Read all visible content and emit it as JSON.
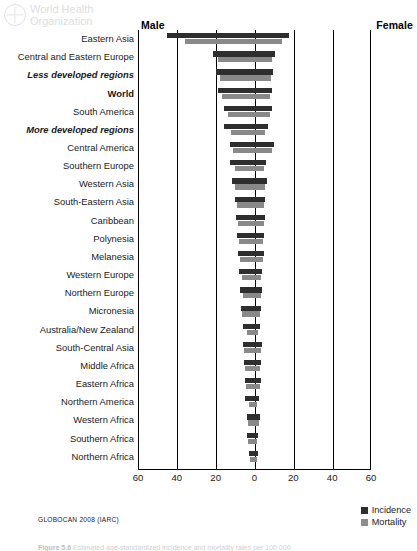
{
  "watermark": {
    "line1": "World Health",
    "line2": "Organization",
    "emblem_icon": "who-emblem-icon"
  },
  "header": {
    "male_label": "Male",
    "female_label": "Female"
  },
  "source_note": "GLOBOCAN 2008 (IARC)",
  "caption": {
    "number": "Figure 5.6",
    "text": "Estimated age-standardized incidence and mortality rates per 100 000"
  },
  "legend": {
    "position": "bottom-right",
    "items": [
      {
        "label": "Incidence",
        "color": "#2e2e2e"
      },
      {
        "label": "Mortality",
        "color": "#898989"
      }
    ]
  },
  "chart_data": {
    "type": "bar",
    "subtype": "diverging-butterfly",
    "title": "",
    "xlabel": "",
    "ylabel": "",
    "xlim": [
      -60,
      60
    ],
    "xticks": [
      60,
      40,
      20,
      0,
      20,
      40,
      60
    ],
    "tick_positions": [
      -60,
      -40,
      -20,
      0,
      20,
      40,
      60
    ],
    "gridlines": [
      -40,
      -20,
      0,
      20,
      40
    ],
    "grid": true,
    "axis_note": "Left half = Male rate, right half = Female rate; both plotted as positive magnitudes outward from 0",
    "series": [
      {
        "name": "Incidence",
        "color": "#2e2e2e"
      },
      {
        "name": "Mortality",
        "color": "#898989"
      }
    ],
    "categories": [
      "Eastern Asia",
      "Central and Eastern Europe",
      "Less developed regions",
      "World",
      "South America",
      "More developed regions",
      "Central America",
      "Southern Europe",
      "Western Asia",
      "South-Eastern Asia",
      "Caribbean",
      "Polynesia",
      "Melanesia",
      "Western Europe",
      "Northern Europe",
      "Micronesia",
      "Australia/New Zealand",
      "South-Central Asia",
      "Middle Africa",
      "Eastern Africa",
      "Northern America",
      "Western Africa",
      "Southern Africa",
      "Northern Africa"
    ],
    "category_styles": [
      "normal",
      "normal",
      "emphasis",
      "strong",
      "normal",
      "emphasis",
      "normal",
      "normal",
      "normal",
      "normal",
      "normal",
      "normal",
      "normal",
      "normal",
      "normal",
      "normal",
      "normal",
      "normal",
      "normal",
      "normal",
      "normal",
      "normal",
      "normal",
      "normal"
    ],
    "rows": [
      {
        "category": "Eastern Asia",
        "male_incidence": 45.0,
        "male_mortality": 36.0,
        "female_incidence": 18.0,
        "female_mortality": 14.0
      },
      {
        "category": "Central and Eastern Europe",
        "male_incidence": 21.5,
        "male_mortality": 19.0,
        "female_incidence": 10.5,
        "female_mortality": 9.0
      },
      {
        "category": "Less developed regions",
        "male_incidence": 20.0,
        "male_mortality": 18.0,
        "female_incidence": 9.5,
        "female_mortality": 8.5
      },
      {
        "category": "World",
        "male_incidence": 19.0,
        "male_mortality": 16.5,
        "female_incidence": 9.0,
        "female_mortality": 8.0
      },
      {
        "category": "South America",
        "male_incidence": 15.5,
        "male_mortality": 13.5,
        "female_incidence": 9.0,
        "female_mortality": 8.0
      },
      {
        "category": "More developed regions",
        "male_incidence": 15.5,
        "male_mortality": 12.0,
        "female_incidence": 7.0,
        "female_mortality": 5.5
      },
      {
        "category": "Central America",
        "male_incidence": 12.5,
        "male_mortality": 11.0,
        "female_incidence": 10.0,
        "female_mortality": 9.0
      },
      {
        "category": "Southern Europe",
        "male_incidence": 12.5,
        "male_mortality": 10.0,
        "female_incidence": 6.0,
        "female_mortality": 5.0
      },
      {
        "category": "Western Asia",
        "male_incidence": 11.5,
        "male_mortality": 10.0,
        "female_incidence": 6.5,
        "female_mortality": 5.5
      },
      {
        "category": "South-Eastern Asia",
        "male_incidence": 10.0,
        "male_mortality": 9.0,
        "female_incidence": 5.5,
        "female_mortality": 5.0
      },
      {
        "category": "Caribbean",
        "male_incidence": 9.5,
        "male_mortality": 8.5,
        "female_incidence": 5.5,
        "female_mortality": 5.0
      },
      {
        "category": "Polynesia",
        "male_incidence": 9.0,
        "male_mortality": 8.0,
        "female_incidence": 5.0,
        "female_mortality": 4.5
      },
      {
        "category": "Melanesia",
        "male_incidence": 8.5,
        "male_mortality": 7.5,
        "female_incidence": 5.0,
        "female_mortality": 4.5
      },
      {
        "category": "Western Europe",
        "male_incidence": 8.0,
        "male_mortality": 6.5,
        "female_incidence": 4.0,
        "female_mortality": 3.5
      },
      {
        "category": "Northern Europe",
        "male_incidence": 7.5,
        "male_mortality": 6.0,
        "female_incidence": 4.0,
        "female_mortality": 3.5
      },
      {
        "category": "Micronesia",
        "male_incidence": 7.0,
        "male_mortality": 6.5,
        "female_incidence": 3.5,
        "female_mortality": 3.0
      },
      {
        "category": "Australia/New Zealand",
        "male_incidence": 6.0,
        "male_mortality": 4.0,
        "female_incidence": 3.0,
        "female_mortality": 2.0
      },
      {
        "category": "South-Central Asia",
        "male_incidence": 6.0,
        "male_mortality": 5.5,
        "female_incidence": 4.0,
        "female_mortality": 3.5
      },
      {
        "category": "Middle Africa",
        "male_incidence": 5.5,
        "male_mortality": 5.0,
        "female_incidence": 3.5,
        "female_mortality": 3.0
      },
      {
        "category": "Eastern Africa",
        "male_incidence": 5.0,
        "male_mortality": 4.5,
        "female_incidence": 3.5,
        "female_mortality": 3.0
      },
      {
        "category": "Northern America",
        "male_incidence": 5.0,
        "male_mortality": 3.0,
        "female_incidence": 2.5,
        "female_mortality": 1.5
      },
      {
        "category": "Western Africa",
        "male_incidence": 4.0,
        "male_mortality": 3.5,
        "female_incidence": 3.0,
        "female_mortality": 2.5
      },
      {
        "category": "Southern Africa",
        "male_incidence": 4.0,
        "male_mortality": 3.5,
        "female_incidence": 2.0,
        "female_mortality": 1.5
      },
      {
        "category": "Northern Africa",
        "male_incidence": 3.0,
        "male_mortality": 2.5,
        "female_incidence": 2.0,
        "female_mortality": 1.5
      }
    ]
  }
}
